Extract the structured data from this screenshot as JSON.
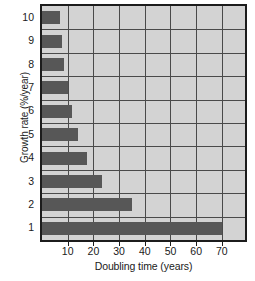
{
  "chart_data": {
    "type": "bar",
    "orientation": "horizontal",
    "title": "",
    "xlabel": "Doubling time (years)",
    "ylabel": "Growth rate (%/year)",
    "categories": [
      "1",
      "2",
      "3",
      "4",
      "5",
      "6",
      "7",
      "8",
      "9",
      "10"
    ],
    "category_order_top_to_bottom": [
      "10",
      "9",
      "8",
      "7",
      "6",
      "5",
      "4",
      "3",
      "2",
      "1"
    ],
    "values": [
      70,
      35,
      23.3,
      17.5,
      14,
      11.7,
      10,
      8.75,
      7.8,
      7
    ],
    "xlim": [
      0,
      79
    ],
    "ylim": [
      0,
      10
    ],
    "xticks": [
      10,
      20,
      30,
      40,
      50,
      60,
      70
    ],
    "xtick_labels": [
      "10",
      "20",
      "30",
      "40",
      "50",
      "60",
      "70"
    ],
    "ytick_labels": [
      "10",
      "9",
      "8",
      "7",
      "6",
      "5",
      "4",
      "3",
      "2",
      "1"
    ],
    "grid": true,
    "grid_axis": "both",
    "legend": "none",
    "bar_color": "#575757",
    "plot_background": "#d3d3d3",
    "grid_color": "#4a4a4a",
    "axis_color": "#1c1c1c",
    "bars": [
      {
        "category": "10",
        "value": 7
      },
      {
        "category": "9",
        "value": 7.8
      },
      {
        "category": "8",
        "value": 8.75
      },
      {
        "category": "7",
        "value": 10
      },
      {
        "category": "6",
        "value": 11.7
      },
      {
        "category": "5",
        "value": 14
      },
      {
        "category": "4",
        "value": 17.5
      },
      {
        "category": "3",
        "value": 23.3
      },
      {
        "category": "2",
        "value": 35
      },
      {
        "category": "1",
        "value": 70
      }
    ]
  }
}
